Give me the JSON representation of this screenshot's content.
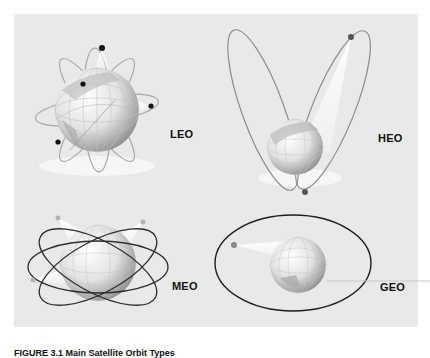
{
  "figure": {
    "panels": [
      {
        "id": "leo",
        "label": "LEO",
        "description": "Low Earth Orbit - multiple inclined circular orbits close to globe with satellites"
      },
      {
        "id": "heo",
        "label": "HEO",
        "description": "Highly Elliptical Orbit - two elongated elliptical orbits with satellite at apogee"
      },
      {
        "id": "meo",
        "label": "MEO",
        "description": "Medium Earth Orbit - three intersecting elliptical orbits around globe"
      },
      {
        "id": "geo",
        "label": "GEO",
        "description": "Geostationary Orbit - single large equatorial orbit with satellite"
      }
    ],
    "caption": "FIGURE 3.1  Main Satellite Orbit Types"
  },
  "colors": {
    "background": "#e9e9e9",
    "orbit_line": "#2a2a2a",
    "leo_orbit": "#a8a8a8",
    "globe_light": "#f4f4f4",
    "globe_dark": "#9a9a9a",
    "satellite": "#111111"
  }
}
